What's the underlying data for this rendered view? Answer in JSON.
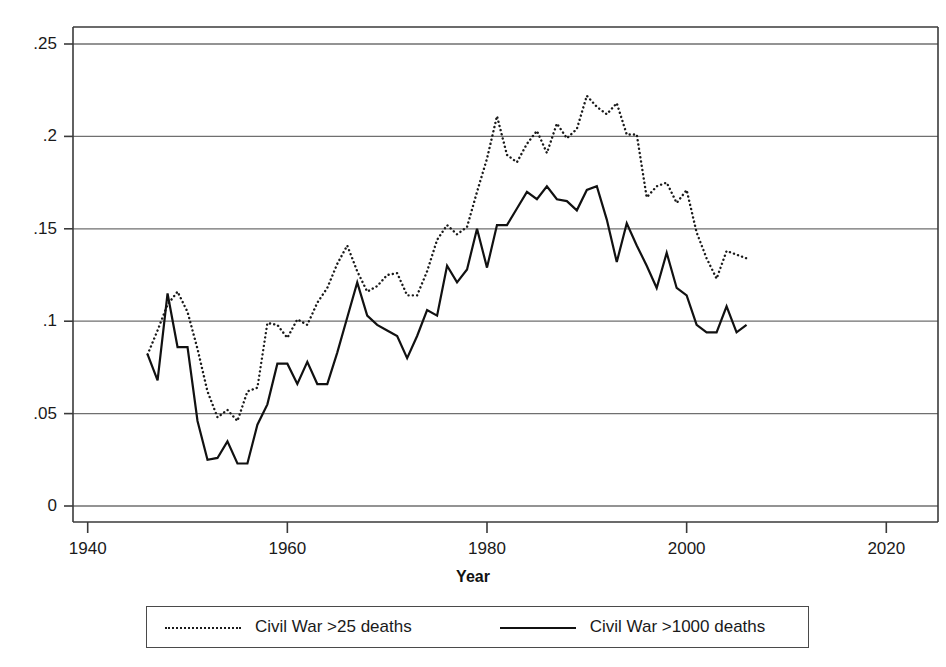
{
  "chart_data": {
    "type": "line",
    "title": "",
    "xlabel": "Year",
    "ylabel": "",
    "xlim": [
      1940,
      2020
    ],
    "ylim": [
      0,
      0.25
    ],
    "grid": true,
    "legend_position": "bottom",
    "xticks": [
      "1940",
      "1960",
      "1980",
      "2000",
      "2020"
    ],
    "yticks": [
      "0",
      ".05",
      ".1",
      ".15",
      ".2",
      ".25"
    ],
    "ytick_values": [
      0,
      0.05,
      0.1,
      0.15,
      0.2,
      0.25
    ],
    "xtick_values": [
      1940,
      1960,
      1980,
      2000,
      2020
    ],
    "x": [
      1946,
      1947,
      1948,
      1949,
      1950,
      1951,
      1952,
      1953,
      1954,
      1955,
      1956,
      1957,
      1958,
      1959,
      1960,
      1961,
      1962,
      1963,
      1964,
      1965,
      1966,
      1967,
      1968,
      1969,
      1970,
      1971,
      1972,
      1973,
      1974,
      1975,
      1976,
      1977,
      1978,
      1979,
      1980,
      1981,
      1982,
      1983,
      1984,
      1985,
      1986,
      1987,
      1988,
      1989,
      1990,
      1991,
      1992,
      1993,
      1994,
      1995,
      1996,
      1997,
      1998,
      1999,
      2000,
      2001,
      2002,
      2003,
      2004,
      2005,
      2006
    ],
    "series": [
      {
        "name": "Civil War >25 deaths",
        "style": "dotted",
        "color": "#1a1a1a",
        "values": [
          0.082,
          0.095,
          0.109,
          0.116,
          0.105,
          0.085,
          0.062,
          0.048,
          0.052,
          0.046,
          0.062,
          0.064,
          0.099,
          0.098,
          0.091,
          0.101,
          0.098,
          0.11,
          0.118,
          0.131,
          0.141,
          0.127,
          0.116,
          0.119,
          0.125,
          0.126,
          0.114,
          0.114,
          0.127,
          0.144,
          0.152,
          0.147,
          0.151,
          0.17,
          0.188,
          0.211,
          0.19,
          0.186,
          0.196,
          0.203,
          0.191,
          0.207,
          0.199,
          0.204,
          0.222,
          0.216,
          0.212,
          0.218,
          0.201,
          0.201,
          0.167,
          0.173,
          0.175,
          0.164,
          0.171,
          0.148,
          0.134,
          0.123,
          0.138,
          0.136,
          0.134
        ]
      },
      {
        "name": "Civil War >1000 deaths",
        "style": "solid",
        "color": "#111111",
        "values": [
          0.082,
          0.068,
          0.115,
          0.086,
          0.086,
          0.046,
          0.025,
          0.026,
          0.035,
          0.023,
          0.023,
          0.044,
          0.055,
          0.077,
          0.077,
          0.066,
          0.078,
          0.066,
          0.066,
          0.083,
          0.102,
          0.121,
          0.103,
          0.098,
          0.095,
          0.092,
          0.08,
          0.092,
          0.106,
          0.103,
          0.13,
          0.121,
          0.128,
          0.15,
          0.129,
          0.152,
          0.152,
          0.161,
          0.17,
          0.166,
          0.173,
          0.166,
          0.165,
          0.16,
          0.171,
          0.173,
          0.155,
          0.132,
          0.153,
          0.141,
          0.13,
          0.118,
          0.137,
          0.118,
          0.114,
          0.098,
          0.094,
          0.094,
          0.108,
          0.094,
          0.098
        ]
      }
    ]
  },
  "legend": {
    "entries": [
      {
        "label": "Civil War >25 deaths",
        "style": "dotted"
      },
      {
        "label": "Civil War >1000 deaths",
        "style": "solid"
      }
    ]
  }
}
